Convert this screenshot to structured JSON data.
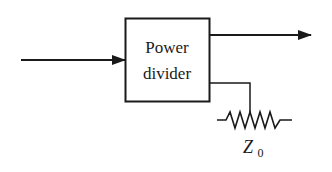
{
  "diagram": {
    "block": {
      "label_line1": "Power",
      "label_line2": "divider"
    },
    "termination": {
      "label_main": "Z",
      "label_sub": "0"
    },
    "ports": {
      "input": "input-arrow",
      "output": "output-arrow",
      "terminated": "terminated-port"
    },
    "colors": {
      "stroke": "#1a1a1a",
      "background": "#ffffff"
    }
  }
}
